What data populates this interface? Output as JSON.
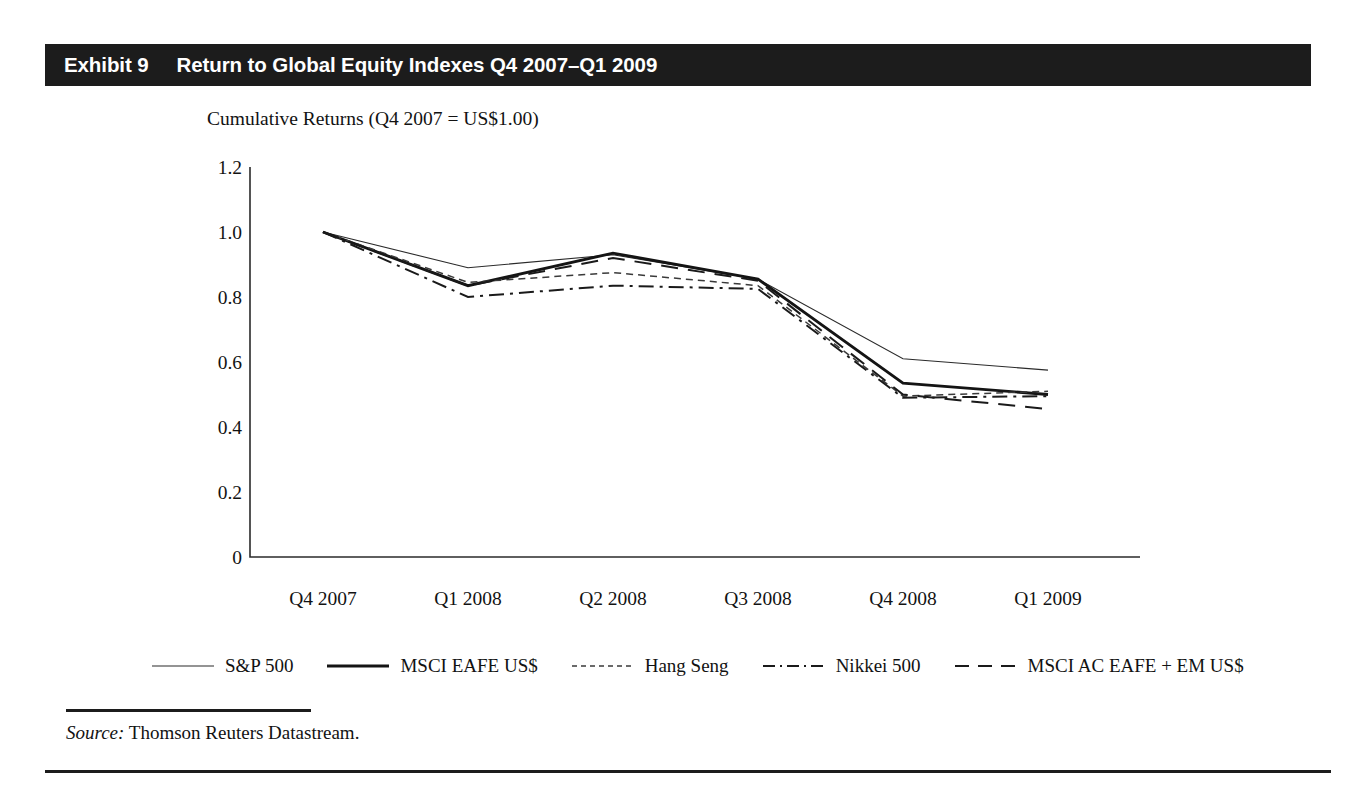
{
  "exhibit": {
    "number_label": "Exhibit 9",
    "title": "Return to Global Equity Indexes Q4 2007–Q1 2009"
  },
  "source": {
    "lead": "Source:",
    "text": " Thomson Reuters Datastream."
  },
  "colors": {
    "bar_background": "#1c1c1c",
    "bar_text": "#ffffff",
    "ink": "#121212",
    "rule": "#1c1c1c",
    "page": "#ffffff"
  },
  "chart_data": {
    "type": "line",
    "title": "Return to Global Equity Indexes Q4 2007–Q1 2009",
    "subtitle": "Cumulative Returns (Q4 2007 = US$1.00)",
    "xlabel": "",
    "ylabel": "",
    "categories": [
      "Q4 2007",
      "Q1 2008",
      "Q2 2008",
      "Q3 2008",
      "Q4 2008",
      "Q1 2009"
    ],
    "yticks": [
      "0",
      "0.2",
      "0.4",
      "0.6",
      "0.8",
      "1.0",
      "1.2"
    ],
    "ytick_values": [
      0,
      0.2,
      0.4,
      0.6,
      0.8,
      1.0,
      1.2
    ],
    "ylim": [
      0,
      1.2
    ],
    "grid": false,
    "legend_position": "bottom",
    "series": [
      {
        "name": "S&P 500",
        "style": "thin-solid",
        "values": [
          1.0,
          0.89,
          0.93,
          0.855,
          0.61,
          0.575
        ]
      },
      {
        "name": "MSCI EAFE US$",
        "style": "thick-solid",
        "values": [
          1.0,
          0.835,
          0.935,
          0.855,
          0.535,
          0.5
        ]
      },
      {
        "name": "Hang Seng",
        "style": "fine-dashed",
        "values": [
          1.0,
          0.845,
          0.875,
          0.835,
          0.495,
          0.51
        ]
      },
      {
        "name": "Nikkei 500",
        "style": "dash-dot",
        "values": [
          1.0,
          0.8,
          0.835,
          0.825,
          0.49,
          0.495
        ]
      },
      {
        "name": "MSCI AC EAFE + EM US$",
        "style": "long-dashed",
        "values": [
          1.0,
          0.835,
          0.92,
          0.85,
          0.5,
          0.455
        ]
      }
    ]
  }
}
